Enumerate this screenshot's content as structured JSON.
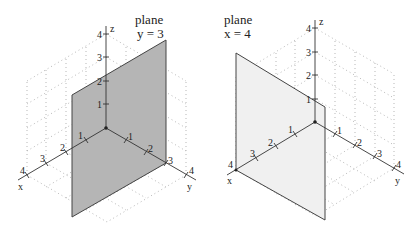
{
  "left": {
    "title_line1": "plane",
    "title_line2": "y = 3",
    "axis_labels": {
      "x": "x",
      "y": "y",
      "z": "z"
    },
    "x_ticks": [
      "1",
      "2",
      "3",
      "4"
    ],
    "y_ticks": [
      "1",
      "2",
      "3",
      "4"
    ],
    "z_ticks": [
      "1",
      "2",
      "3",
      "4"
    ],
    "plane_color": "#b5b5b5"
  },
  "right": {
    "title_line1": "plane",
    "title_line2": "x = 4",
    "axis_labels": {
      "x": "x",
      "y": "y",
      "z": "z"
    },
    "x_ticks": [
      "1",
      "2",
      "3",
      "4"
    ],
    "y_ticks": [
      "1",
      "2",
      "3",
      "4"
    ],
    "z_ticks": [
      "1",
      "2",
      "3",
      "4"
    ],
    "plane_color": "#f0f0f0"
  }
}
